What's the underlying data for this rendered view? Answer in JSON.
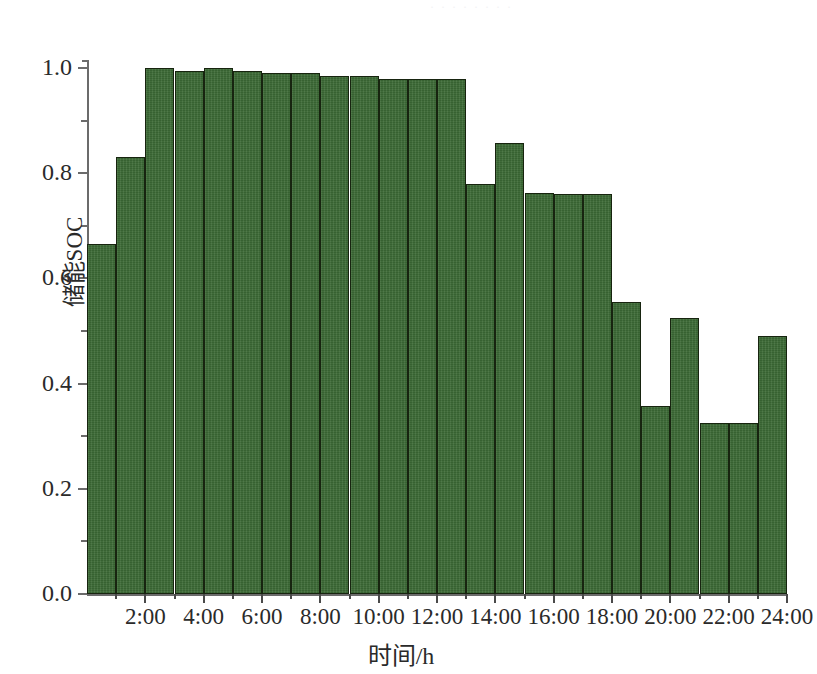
{
  "figure": {
    "top_cropped_text": "· · · · · · · ·",
    "background_color": "#ffffff"
  },
  "chart_data": {
    "type": "bar",
    "title": "",
    "xlabel": "时间/h",
    "ylabel": "储能SOC",
    "categories": [
      "1:00",
      "2:00",
      "3:00",
      "4:00",
      "5:00",
      "6:00",
      "7:00",
      "8:00",
      "9:00",
      "10:00",
      "11:00",
      "12:00",
      "13:00",
      "14:00",
      "15:00",
      "16:00",
      "17:00",
      "18:00",
      "19:00",
      "20:00",
      "21:00",
      "22:00",
      "23:00",
      "24:00"
    ],
    "values": [
      0.665,
      0.83,
      1.0,
      0.995,
      1.0,
      0.995,
      0.99,
      0.99,
      0.985,
      0.985,
      0.98,
      0.98,
      0.98,
      0.78,
      0.858,
      0.763,
      0.76,
      0.76,
      0.556,
      0.357,
      0.524,
      0.326,
      0.326,
      0.49
    ],
    "series": [
      {
        "name": "储能SOC",
        "values": [
          0.665,
          0.83,
          1.0,
          0.995,
          1.0,
          0.995,
          0.99,
          0.99,
          0.985,
          0.985,
          0.98,
          0.98,
          0.98,
          0.78,
          0.858,
          0.763,
          0.76,
          0.76,
          0.556,
          0.357,
          0.524,
          0.326,
          0.326,
          0.49
        ],
        "color": "#3d6b36",
        "edge_color": "#17240f"
      }
    ],
    "ylim": [
      0.0,
      1.0
    ],
    "xlim": [
      0,
      24
    ],
    "y_ticks": [
      "0.0",
      "0.2",
      "0.4",
      "0.6",
      "0.8",
      "1.0"
    ],
    "y_tick_values": [
      0.0,
      0.2,
      0.4,
      0.6,
      0.8,
      1.0
    ],
    "y_minor_tick_values": [
      0.1,
      0.3,
      0.5,
      0.7,
      0.9
    ],
    "x_ticks": [
      "2:00",
      "4:00",
      "6:00",
      "8:00",
      "10:00",
      "12:00",
      "14:00",
      "16:00",
      "18:00",
      "20:00",
      "22:00",
      "24:00"
    ],
    "x_tick_values": [
      2,
      4,
      6,
      8,
      10,
      12,
      14,
      16,
      18,
      20,
      22,
      24
    ],
    "grid": false,
    "legend": null,
    "legend_position": "none",
    "bar_count": 24,
    "bar_width_fraction": 1.0
  }
}
